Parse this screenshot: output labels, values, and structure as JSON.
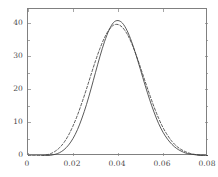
{
  "chart_data": {
    "type": "line",
    "title": "",
    "xlabel": "",
    "ylabel": "",
    "xlim": [
      0,
      0.08
    ],
    "ylim": [
      0,
      44.5
    ],
    "grid": false,
    "legend": "none",
    "frame": "box",
    "xticks": [
      0,
      0.02,
      0.04,
      0.06,
      0.08
    ],
    "xtick_labels": [
      "0",
      "0.02",
      "0.04",
      "0.06",
      "0.08"
    ],
    "yticks": [
      0,
      10,
      20,
      30,
      40
    ],
    "ytick_labels": [
      "0",
      "10",
      "20",
      "30",
      "40"
    ],
    "y_minor_ticks": [
      5,
      15,
      25,
      35
    ],
    "series": [
      {
        "name": "solid",
        "style": "solid",
        "color": "#3c3c3c",
        "peak_x": 0.0395,
        "peak_y": 41.0,
        "x": [
          0.0,
          0.002,
          0.004,
          0.006,
          0.008,
          0.01,
          0.012,
          0.014,
          0.016,
          0.018,
          0.02,
          0.022,
          0.024,
          0.026,
          0.028,
          0.03,
          0.032,
          0.034,
          0.036,
          0.038,
          0.04,
          0.042,
          0.044,
          0.046,
          0.048,
          0.05,
          0.052,
          0.054,
          0.056,
          0.058,
          0.06,
          0.062,
          0.064,
          0.066,
          0.068,
          0.07,
          0.072,
          0.074,
          0.076,
          0.078,
          0.08
        ],
        "y": [
          0.0,
          0.0,
          0.0,
          0.0,
          0.1,
          0.2,
          0.5,
          1.0,
          1.9,
          3.3,
          5.3,
          8.0,
          11.5,
          15.6,
          20.3,
          25.3,
          30.2,
          34.6,
          38.1,
          40.4,
          41.0,
          40.2,
          38.0,
          34.7,
          30.6,
          26.1,
          21.5,
          17.2,
          13.3,
          9.9,
          7.2,
          5.1,
          3.5,
          2.3,
          1.5,
          0.9,
          0.6,
          0.4,
          0.2,
          0.1,
          0.1
        ]
      },
      {
        "name": "dashed",
        "style": "dashed",
        "color": "#3c3c3c",
        "peak_x": 0.037,
        "peak_y": 39.8,
        "x": [
          0.0,
          0.002,
          0.004,
          0.006,
          0.008,
          0.01,
          0.012,
          0.014,
          0.016,
          0.018,
          0.02,
          0.022,
          0.024,
          0.026,
          0.028,
          0.03,
          0.032,
          0.034,
          0.036,
          0.038,
          0.04,
          0.042,
          0.044,
          0.046,
          0.048,
          0.05,
          0.052,
          0.054,
          0.056,
          0.058,
          0.06,
          0.062,
          0.064,
          0.066,
          0.068,
          0.07,
          0.072,
          0.074,
          0.076,
          0.078,
          0.08
        ],
        "y": [
          0.0,
          0.0,
          0.0,
          0.1,
          0.3,
          0.7,
          1.4,
          2.5,
          4.1,
          6.3,
          9.1,
          12.4,
          16.2,
          20.3,
          24.6,
          28.8,
          32.6,
          35.8,
          38.2,
          39.6,
          39.8,
          38.9,
          37.0,
          34.2,
          30.7,
          26.8,
          22.7,
          18.7,
          14.9,
          11.5,
          8.6,
          6.3,
          4.4,
          3.0,
          2.0,
          1.3,
          0.8,
          0.5,
          0.3,
          0.2,
          0.1
        ]
      }
    ]
  }
}
